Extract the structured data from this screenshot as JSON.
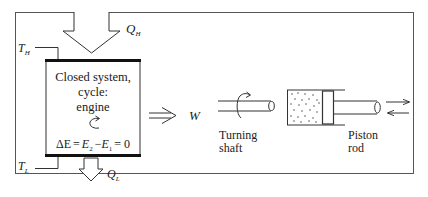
{
  "diagram": {
    "heat_in": {
      "symbol": "Q",
      "subscript": "H"
    },
    "heat_out": {
      "symbol": "Q",
      "subscript": "L"
    },
    "reservoir_high": {
      "symbol": "T",
      "subscript": "H"
    },
    "reservoir_low": {
      "symbol": "T",
      "subscript": "L"
    },
    "system_box": {
      "line1": "Closed system,",
      "line2": "cycle:",
      "line3": "engine",
      "cycle_icon": "circular-arrow-icon",
      "equation": {
        "lhs": "ΔE",
        "eq": "=",
        "e2": "E",
        "e2_sub": "2",
        "minus": "−",
        "e1": "E",
        "e1_sub": "1",
        "rhs": "= 0"
      }
    },
    "work_output": {
      "arrow_icon": "double-arrow-right-icon",
      "label": "W"
    },
    "turning_shaft": {
      "label_line1": "Turning",
      "label_line2": "shaft"
    },
    "piston_rod": {
      "label_line1": "Piston",
      "label_line2": "rod"
    },
    "colors": {
      "stroke": "#1a1a1a",
      "frame": "#555555",
      "background": "#ffffff"
    }
  }
}
